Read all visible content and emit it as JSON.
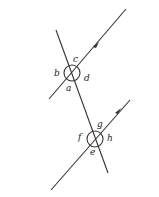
{
  "diagram": {
    "type": "parallel-lines-transversal",
    "stroke_color": "#333333",
    "labels": {
      "upper_intersection": {
        "a": "a",
        "b": "b",
        "c": "c",
        "d": "d"
      },
      "lower_intersection": {
        "e": "e",
        "f": "f",
        "g": "g",
        "h": "h"
      }
    }
  }
}
